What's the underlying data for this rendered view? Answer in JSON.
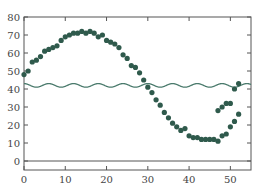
{
  "chart_data": {
    "type": "scatter",
    "title": "",
    "xlabel": "",
    "ylabel": "",
    "xlim": [
      0,
      55
    ],
    "ylim": [
      -5,
      80
    ],
    "grid": false,
    "x_ticks": [
      0,
      10,
      20,
      30,
      40,
      50
    ],
    "x_tick_labels": [
      "0",
      "10",
      "20",
      "30",
      "40",
      "50"
    ],
    "y_ticks": [
      0,
      10,
      20,
      30,
      40,
      50,
      60,
      70,
      80
    ],
    "y_tick_labels": [
      "0",
      "10",
      "20",
      "30",
      "40",
      "50",
      "60",
      "70",
      "80"
    ],
    "hline": {
      "y": 0,
      "color": "#555555"
    },
    "series": [
      {
        "name": "observations",
        "kind": "scatter",
        "color": "#2f5a4c",
        "x": [
          0,
          1,
          2,
          3,
          4,
          5,
          6,
          7,
          8,
          9,
          10,
          11,
          12,
          13,
          14,
          15,
          16,
          17,
          18,
          19,
          20,
          21,
          22,
          23,
          24,
          25,
          26,
          27,
          28,
          29,
          30,
          31,
          32,
          33,
          34,
          35,
          36,
          37,
          38,
          39,
          40,
          41,
          42,
          43,
          44,
          45,
          46,
          47,
          48,
          49,
          50,
          51,
          52
        ],
        "y": [
          48,
          50,
          55,
          56,
          58,
          61,
          62,
          63,
          64,
          67,
          69,
          70,
          71,
          71,
          72,
          71,
          72,
          71,
          69,
          70,
          67,
          66,
          65,
          63,
          59,
          57,
          53,
          52,
          49,
          45,
          41,
          38,
          34,
          31,
          27,
          24,
          21,
          19,
          17,
          18,
          14,
          13,
          13,
          12,
          12,
          12,
          12,
          11,
          14,
          15,
          19,
          22,
          26
        ]
      },
      {
        "name": "baseline-wave",
        "kind": "line",
        "color": "#4a7a6c",
        "center": 42,
        "amplitude": 1,
        "period": 6,
        "x_range": [
          0,
          55
        ]
      }
    ],
    "extra_points": [
      {
        "x": 47,
        "y": 28
      },
      {
        "x": 48,
        "y": 30
      },
      {
        "x": 49,
        "y": 32
      },
      {
        "x": 50,
        "y": 32
      },
      {
        "x": 51,
        "y": 40
      },
      {
        "x": 52,
        "y": 43
      }
    ]
  }
}
